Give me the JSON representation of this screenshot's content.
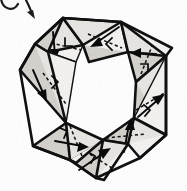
{
  "figure": {
    "title": "ring of hinged tetrahedra (kaleidocycle)",
    "caption": "",
    "background_color": "#ffffff",
    "ink_color": "#101010",
    "facet_fill_color": "#e9e7e4",
    "facet_fill_shadow_color": "#d6d3cf",
    "facet_fill_highlight_color": "#f4f3f1",
    "unit_count": 8,
    "center_region": "hollow-white-octagonal-opening",
    "style": "hand-drawn pen-and-ink line art with stippled grey shading"
  },
  "callout": {
    "name": "rotation-callout-arrow",
    "shape": "curved-arrow",
    "direction": "down-right",
    "position": "top-left-corner",
    "clipped": "partially cropped by top edge",
    "label": ""
  },
  "units": [
    {
      "id": 1,
      "name": "tetrahedron-unit-top",
      "position": "top",
      "hinge": "dashed-fold-line",
      "arrow_direction": "down-left",
      "angle_mark": true
    },
    {
      "id": 2,
      "name": "tetrahedron-unit-top-right",
      "position": "top-right",
      "hinge": "dashed-fold-line",
      "arrow_direction": "left",
      "angle_mark": true
    },
    {
      "id": 3,
      "name": "tetrahedron-unit-right",
      "position": "right",
      "hinge": "dashed-fold-line",
      "arrow_direction": "up-right",
      "angle_mark": true
    },
    {
      "id": 4,
      "name": "tetrahedron-unit-bottom-right",
      "position": "bottom-right",
      "hinge": "dashed-fold-line",
      "arrow_direction": "up",
      "angle_mark": true
    },
    {
      "id": 5,
      "name": "tetrahedron-unit-bottom",
      "position": "bottom",
      "hinge": "dashed-fold-line",
      "arrow_direction": "up-right",
      "angle_mark": true
    },
    {
      "id": 6,
      "name": "tetrahedron-unit-bottom-left",
      "position": "bottom-left",
      "hinge": "dashed-fold-line",
      "arrow_direction": "right",
      "angle_mark": true
    },
    {
      "id": 7,
      "name": "tetrahedron-unit-left",
      "position": "left",
      "hinge": "dashed-fold-line",
      "arrow_direction": "down",
      "angle_mark": true
    },
    {
      "id": 8,
      "name": "tetrahedron-unit-top-left",
      "position": "top-left",
      "hinge": "dashed-fold-line",
      "arrow_direction": "down",
      "angle_mark": true
    }
  ]
}
